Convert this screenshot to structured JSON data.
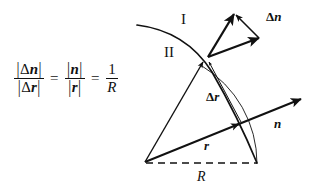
{
  "figure": {
    "background_color": "#ffffff",
    "ink_color": "#111111"
  },
  "equation": {
    "left_fraction": {
      "numerator": "|Δn|",
      "denominator": "|Δr|",
      "numerator_parts": {
        "bar_open": "|",
        "delta": "Δ",
        "symbol": "n",
        "bar_close": "|"
      },
      "denominator_parts": {
        "bar_open": "|",
        "delta": "Δ",
        "symbol": "r",
        "bar_close": "|"
      }
    },
    "equals_1": "=",
    "middle_fraction": {
      "numerator": "|n|",
      "denominator": "|r|",
      "numerator_parts": {
        "bar_open": "|",
        "symbol": "n",
        "bar_close": "|"
      },
      "denominator_parts": {
        "bar_open": "|",
        "symbol": "r",
        "bar_close": "|"
      }
    },
    "equals_2": "=",
    "right_fraction": {
      "numerator": "1",
      "denominator": "R"
    },
    "full_text": "|Δn| / |Δr| = |n| / |r| = 1 / R"
  },
  "diagram": {
    "labels": {
      "region_one": "I",
      "region_two": "II",
      "delta_n": {
        "delta": "Δ",
        "symbol": "n"
      },
      "delta_r": {
        "delta": "Δ",
        "symbol": "r"
      },
      "n": "n",
      "r": "r",
      "R": "R"
    },
    "geometry": {
      "origin": {
        "x": 144,
        "y": 163
      },
      "vertex_upper": {
        "x": 208,
        "y": 57
      },
      "point_on_arc_lower": {
        "x": 240,
        "y": 124
      },
      "radius_dashed_end": {
        "x": 257,
        "y": 163
      },
      "n_arrow_tip": {
        "x": 300,
        "y": 100
      },
      "delta_n_triangle": {
        "tail": {
          "x": 208,
          "y": 57
        },
        "tip_a": {
          "x": 234,
          "y": 14
        },
        "tip_b": {
          "x": 259,
          "y": 38
        }
      },
      "interface_curve": {
        "start": {
          "x": 137,
          "y": 25
        },
        "end": {
          "x": 257,
          "y": 163
        }
      },
      "thin_radius_arc": {
        "from_angle_deg": 0,
        "to_angle_deg": 59
      }
    }
  }
}
